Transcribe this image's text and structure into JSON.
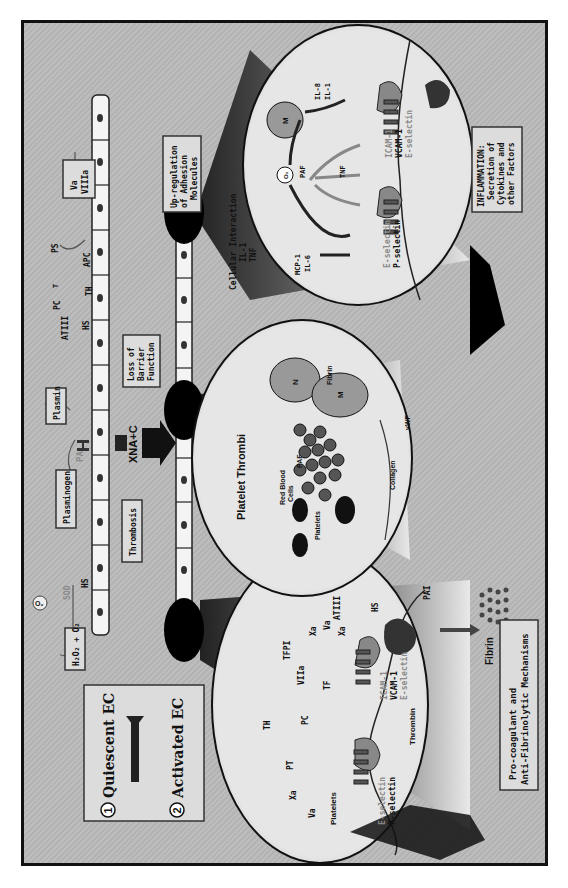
{
  "legend": {
    "step1_num": "1",
    "step1_label": "Quiescent EC",
    "step2_num": "2",
    "step2_label": "Activated EC"
  },
  "top_vessel": {
    "o2_radical": "O₂",
    "sod": "SOD",
    "hs": "HS",
    "h2o2_box": "H₂O₂ + O₂",
    "plasminogen_box": "Plasminogen",
    "pa": "PA",
    "plasmin_box": "Plasmin",
    "atiii": "ATIII",
    "hs2": "HS",
    "pc": "PC",
    "t": "T",
    "th": "TH",
    "apc": "APC",
    "ps": "PS",
    "va_viiia_box": [
      "Va",
      "VIIIa"
    ]
  },
  "center": {
    "xna_c": "XNA+C",
    "thrombosis_box": "Thrombosis",
    "loss_barrier_box": [
      "Loss of",
      "Barrier",
      "Function"
    ],
    "platelet_thrombi": "Platelet Thrombi",
    "cellular_interaction": "Cellular Interaction",
    "il1": "IL-1",
    "tnf": "TNF",
    "upregulation_box": [
      "Up-regulation",
      "of Adhesion",
      "Molecules"
    ]
  },
  "circle_procoagulant": {
    "va": "Va",
    "xa": "Xa",
    "pt": "PT",
    "pc": "PC",
    "th": "TH",
    "viiia": "VIIa",
    "tfpi": "TFPI",
    "xa2": "Xa",
    "va2": "Va",
    "xa3": "Xa",
    "tf": "TF",
    "atiii": "ATIII",
    "hs": "HS",
    "platelets": "Platelets",
    "e_selectin": "E-selectin",
    "p_selectin": "P-selectin",
    "thrombin": "Thrombin",
    "icam": "ICAM-1",
    "vcam": "VCAM-1",
    "e_selectin2": "E-selectin"
  },
  "circle_thrombi": {
    "red_blood_cells": [
      "Red Blood",
      "Cells"
    ],
    "platelets": "Platelets",
    "paf": "PAF",
    "n": "N",
    "m": "M",
    "fibrin": "Fibrin",
    "collagen": "Collagen",
    "vwf": "vWF"
  },
  "circle_inflammation": {
    "mcp1": "MCP-1",
    "il6": "IL-6",
    "o2": "O₂",
    "paf": "PAF",
    "m": "M",
    "il8": "IL-8",
    "il1": "IL-1",
    "tnf": "TNF",
    "e_selectin": "E-selectin",
    "p_selectin": "P-selectin",
    "icam": "ICAM-1",
    "vcam": "VCAM-1",
    "e_selectin2": "E-selectin"
  },
  "bottom": {
    "fibrin": "Fibrin",
    "pai": "PAI",
    "procoag_box": [
      "Pro-coagulant and",
      "Anti-Fibrinolytic Mechanisms"
    ],
    "inflammation_box": [
      "INFLAMMATION:",
      "Secretion of",
      "Cytokines and",
      "other Factors"
    ]
  }
}
